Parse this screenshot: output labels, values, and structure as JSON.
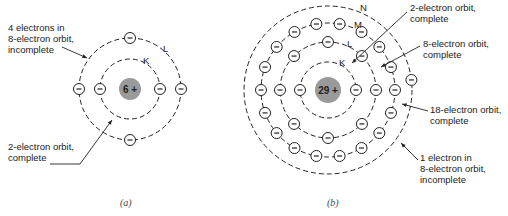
{
  "diagram_a": {
    "nucleus_label": "6 +",
    "shells": [
      {
        "name": "K",
        "electrons": 2
      },
      {
        "name": "L",
        "electrons": 4
      }
    ],
    "annotations": {
      "outer": "4 electrons in\n8-electron orbit,\nincomplete",
      "inner": "2-electron orbit,\ncomplete"
    },
    "caption": "(a)"
  },
  "diagram_b": {
    "nucleus_label": "29 +",
    "shells": [
      {
        "name": "K",
        "electrons": 2
      },
      {
        "name": "L",
        "electrons": 8
      },
      {
        "name": "M",
        "electrons": 18
      },
      {
        "name": "N",
        "electrons": 1
      }
    ],
    "annotations": {
      "k": "2-electron orbit,\ncomplete",
      "l": "8-electron orbit,\ncomplete",
      "m": "18-electron orbit,\ncomplete",
      "n": "1 electron in\n8-electron orbit,\nincomplete"
    },
    "caption": "(b)"
  },
  "colors": {
    "nucleus": "#9a9a9a",
    "line": "#222222"
  }
}
